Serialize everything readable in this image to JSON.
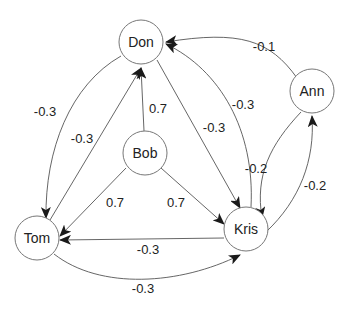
{
  "diagram": {
    "type": "directed-weighted-graph",
    "nodes": {
      "don": {
        "label": "Don"
      },
      "ann": {
        "label": "Ann"
      },
      "bob": {
        "label": "Bob"
      },
      "tom": {
        "label": "Tom"
      },
      "kris": {
        "label": "Kris"
      }
    },
    "edges": {
      "ann_don": {
        "from": "Ann",
        "to": "Don",
        "weight": "-0.1"
      },
      "kris_don": {
        "from": "Kris",
        "to": "Don",
        "weight": "-0.3"
      },
      "don_kris": {
        "from": "Don",
        "to": "Kris",
        "weight": "-0.3"
      },
      "don_tom": {
        "from": "Don",
        "to": "Tom",
        "weight": "-0.3"
      },
      "tom_don": {
        "from": "Tom",
        "to": "Don",
        "weight": "-0.3"
      },
      "bob_don": {
        "from": "Bob",
        "to": "Don",
        "weight": "0.7"
      },
      "bob_tom": {
        "from": "Bob",
        "to": "Tom",
        "weight": "0.7"
      },
      "bob_kris": {
        "from": "Bob",
        "to": "Kris",
        "weight": "0.7"
      },
      "ann_kris": {
        "from": "Ann",
        "to": "Kris",
        "weight": "-0.2"
      },
      "kris_ann": {
        "from": "Kris",
        "to": "Ann",
        "weight": "-0.2"
      },
      "kris_tom": {
        "from": "Kris",
        "to": "Tom",
        "weight": "-0.3"
      },
      "tom_kris": {
        "from": "Tom",
        "to": "Kris",
        "weight": "-0.3"
      }
    }
  }
}
